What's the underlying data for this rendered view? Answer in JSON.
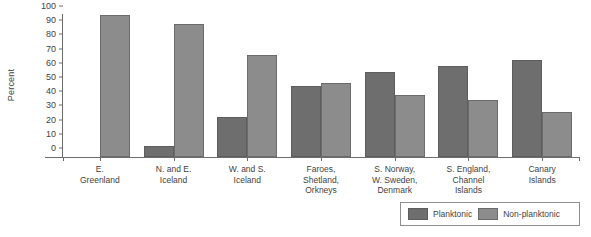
{
  "chart_data": {
    "type": "bar",
    "title": "",
    "xlabel": "",
    "ylabel": "Percent",
    "ylim": [
      0,
      100
    ],
    "yticks": [
      0,
      10,
      20,
      30,
      40,
      50,
      60,
      70,
      80,
      90,
      100
    ],
    "grid": false,
    "legend_position": "bottom-right",
    "categories": [
      "E.\nGreenland",
      "N. and E.\nIceland",
      "W. and S.\nIceland",
      "Faroes,\nShetland,\nOrkneys",
      "S. Norway,\nW. Sweden,\nDenmark",
      "S. England,\nChannel\nIslands",
      "Canary\nIslands"
    ],
    "series": [
      {
        "name": "Planktonic",
        "color": "#6e6e6e",
        "values": [
          0,
          8,
          28,
          50,
          60,
          64,
          68
        ]
      },
      {
        "name": "Non-planktonic",
        "color": "#8c8c8c",
        "values": [
          100,
          94,
          72,
          52,
          44,
          40,
          32
        ]
      }
    ]
  },
  "axis": {
    "y_title": "Percent"
  },
  "legend": {
    "items": [
      {
        "label": "Planktonic",
        "color": "#6e6e6e"
      },
      {
        "label": "Non-planktonic",
        "color": "#8c8c8c"
      }
    ]
  }
}
